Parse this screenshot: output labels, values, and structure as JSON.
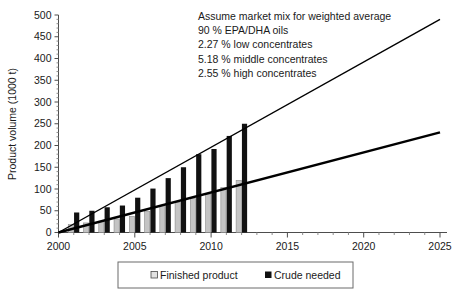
{
  "chart_data": {
    "type": "bar",
    "title": "",
    "subtitle": "",
    "xlabel": "",
    "ylabel": "Product volume (1000 t)",
    "xlim": [
      2000,
      2025
    ],
    "ylim": [
      0,
      500
    ],
    "ytick_step": 50,
    "xtick_step": 5,
    "grid": false,
    "legend_position": "bottom",
    "categories": [
      2001,
      2002,
      2003,
      2004,
      2005,
      2006,
      2007,
      2008,
      2009,
      2010,
      2011,
      2012
    ],
    "xtick_labels": [
      "2000",
      "2005",
      "2010",
      "2015",
      "2020",
      "2025"
    ],
    "ytick_labels": [
      "0",
      "50",
      "100",
      "150",
      "200",
      "250",
      "300",
      "350",
      "400",
      "450",
      "500"
    ],
    "series": [
      {
        "name": "Finished product",
        "color": "#c4c4c4",
        "values": [
          18,
          22,
          26,
          31,
          37,
          48,
          62,
          70,
          78,
          87,
          103,
          120
        ]
      },
      {
        "name": "Crude needed",
        "color": "#111111",
        "values": [
          46,
          50,
          58,
          62,
          80,
          101,
          125,
          150,
          180,
          192,
          222,
          250
        ]
      }
    ],
    "trend_lines": [
      {
        "name": "crude-trend",
        "x": [
          2000,
          2025
        ],
        "y": [
          0,
          490
        ]
      },
      {
        "name": "finished-trend",
        "x": [
          2000,
          2025
        ],
        "y": [
          0,
          230
        ]
      }
    ],
    "annotations": [
      "Assume market mix for weighted average",
      "90 % EPA/DHA oils",
      "2.27 % low concentrates",
      "5.18 % middle concentrates",
      "2.55 % high concentrates"
    ]
  },
  "legend": {
    "items": [
      {
        "label": "Finished product",
        "marker": "square-light"
      },
      {
        "label": "Crude needed",
        "marker": "square-dark"
      }
    ]
  }
}
